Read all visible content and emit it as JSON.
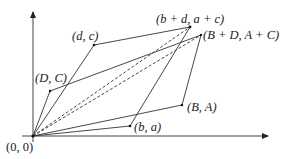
{
  "diagram": {
    "type": "vector-addition-parallelograms",
    "colors": {
      "line": "#333333",
      "text": "#222222",
      "background": "#ffffff"
    },
    "axes": {
      "origin": {
        "x": 33,
        "y": 136
      },
      "x_axis_end": {
        "x": 269,
        "y": 136
      },
      "y_axis_end": {
        "x": 33,
        "y": 12
      }
    },
    "points": {
      "origin": {
        "label": "(0, 0)",
        "x": 33,
        "y": 136
      },
      "DC": {
        "label": "(D, C)",
        "x": 50,
        "y": 91
      },
      "dc": {
        "label": "(d, c)",
        "x": 94,
        "y": 45
      },
      "ba": {
        "label": "(b, a)",
        "x": 130,
        "y": 126
      },
      "BA": {
        "label": "(B, A)",
        "x": 182,
        "y": 105
      },
      "sum_lower": {
        "label": "(b + d, a + c)",
        "x": 190,
        "y": 27
      },
      "sum_upper": {
        "label": "(B + D, A + C)",
        "x": 201,
        "y": 35
      }
    },
    "labels": {
      "origin": "(0, 0)",
      "DC": "(D, C)",
      "dc": "(d, c)",
      "ba": "(b, a)",
      "BA": "(B, A)",
      "sum_lower": "(b + d, a + c)",
      "sum_upper": "(B + D, A + C)"
    },
    "edges": {
      "solid": [
        [
          "origin",
          "DC"
        ],
        [
          "origin",
          "dc"
        ],
        [
          "origin",
          "ba"
        ],
        [
          "origin",
          "BA"
        ],
        [
          "dc",
          "sum_lower"
        ],
        [
          "ba",
          "sum_lower"
        ],
        [
          "DC",
          "sum_upper"
        ],
        [
          "BA",
          "sum_upper"
        ]
      ],
      "dashed": [
        [
          "origin",
          "sum_lower"
        ],
        [
          "origin",
          "sum_upper"
        ]
      ]
    }
  }
}
